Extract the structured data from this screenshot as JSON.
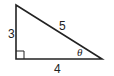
{
  "diagram": {
    "type": "right-triangle",
    "labels": {
      "vertical_side": "3",
      "hypotenuse": "5",
      "horizontal_side": "4",
      "angle": "θ"
    },
    "vertices": {
      "top": [
        16,
        5
      ],
      "right_angle": [
        16,
        59
      ],
      "acute_angle": [
        102,
        59
      ]
    },
    "right_angle_marker": true,
    "stroke_color": "#222222",
    "background_color": "#ffffff"
  }
}
